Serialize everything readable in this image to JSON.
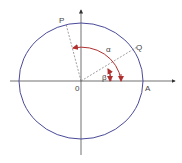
{
  "diagram": {
    "labels": {
      "P": "P",
      "Q": "Q",
      "O": "0",
      "A": "A",
      "alpha": "α",
      "beta": "β"
    },
    "colors": {
      "circle": "#4a4a9a",
      "axes": "#333333",
      "rays": "#777777",
      "arcs": "#b03030"
    }
  }
}
